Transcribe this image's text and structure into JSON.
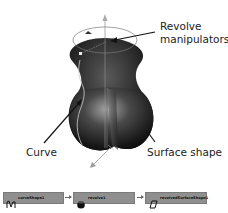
{
  "labels": {
    "revolve_line1": "Revolve",
    "revolve_line2": "manipulators",
    "curve": "Curve",
    "surface": "Surface shape"
  },
  "node_graph": {
    "nodes": [
      {
        "name": "curveShape1",
        "icon": "curve-icon"
      },
      {
        "name": "revolve1",
        "icon": "revolve-icon"
      },
      {
        "name": "revolvedSurfaceShape1",
        "icon": "surface-icon"
      }
    ],
    "connections": [
      {
        "from": "curveShape1",
        "to": "revolve1"
      },
      {
        "from": "revolve1",
        "to": "revolvedSurfaceShape1"
      }
    ]
  },
  "colors": {
    "node_fill": "#8f8f8f",
    "shape_dark": "#111111",
    "shape_highlight": "#9a9a9a",
    "manipulator": "#777777"
  }
}
